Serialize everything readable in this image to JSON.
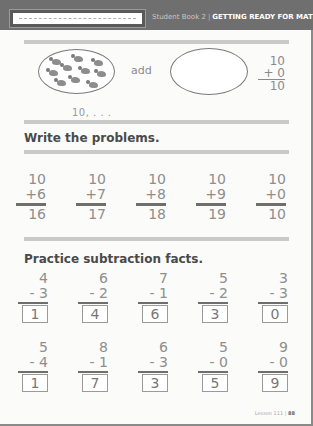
{
  "header": {
    "name_box_placeholder": "",
    "book": "Student Book 2",
    "separator": "|",
    "title": "GETTING READY FOR MATH"
  },
  "intro": {
    "left_oval_birds": 10,
    "right_oval_birds": 0,
    "add_label": "add",
    "count_label": "10, . . .",
    "vertical_problem": {
      "top": "10",
      "operator_line": "+ 0",
      "answer": "10"
    }
  },
  "write_problems": {
    "title": "Write the problems.",
    "problems": [
      {
        "top": "10",
        "bottom": "+6",
        "answer": "16"
      },
      {
        "top": "10",
        "bottom": "+7",
        "answer": "17"
      },
      {
        "top": "10",
        "bottom": "+8",
        "answer": "18"
      },
      {
        "top": "10",
        "bottom": "+9",
        "answer": "19"
      },
      {
        "top": "10",
        "bottom": "+0",
        "answer": "10"
      }
    ]
  },
  "subtraction": {
    "title": "Practice subtraction facts.",
    "row1": [
      {
        "top": "4",
        "bottom": "- 3",
        "answer": "1"
      },
      {
        "top": "6",
        "bottom": "- 2",
        "answer": "4"
      },
      {
        "top": "7",
        "bottom": "- 1",
        "answer": "6"
      },
      {
        "top": "5",
        "bottom": "- 2",
        "answer": "3"
      },
      {
        "top": "3",
        "bottom": "- 3",
        "answer": "0"
      }
    ],
    "row2": [
      {
        "top": "5",
        "bottom": "- 4",
        "answer": "1"
      },
      {
        "top": "8",
        "bottom": "- 1",
        "answer": "7"
      },
      {
        "top": "6",
        "bottom": "- 3",
        "answer": "3"
      },
      {
        "top": "5",
        "bottom": "- 0",
        "answer": "5"
      },
      {
        "top": "9",
        "bottom": "- 0",
        "answer": "9"
      }
    ]
  },
  "footer": {
    "lesson": "Lesson 111",
    "separator": "|",
    "page": "88"
  }
}
